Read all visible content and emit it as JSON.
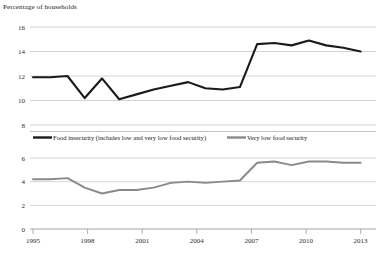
{
  "chart_data": {
    "type": "line",
    "title": "Percentage of households",
    "xlabel": "",
    "ylabel": "Percentage of households",
    "grid": true,
    "legend_position": "middle",
    "panels": [
      {
        "name": "food-insecurity-panel",
        "ylim": [
          8,
          16
        ],
        "yticks": [
          8,
          10,
          12,
          14,
          16
        ],
        "ytick_labels": [
          "8",
          "10",
          "12",
          "14",
          "16"
        ],
        "series_name": "Food insecurity (includes low and very low food security)",
        "color": "#1a1a1a"
      },
      {
        "name": "very-low-food-security-panel",
        "ylim": [
          0,
          6
        ],
        "yticks": [
          0,
          2,
          4,
          6
        ],
        "ytick_labels": [
          "0",
          "2",
          "4",
          "6"
        ],
        "series_name": "Very low food security",
        "color": "#8a8a8a"
      }
    ],
    "x": [
      1995,
      1996,
      1997,
      1998,
      1999,
      2000,
      2001,
      2002,
      2003,
      2004,
      2005,
      2006,
      2007,
      2008,
      2009,
      2010,
      2011,
      2012,
      2013,
      2014
    ],
    "xticks": [
      1995,
      1998,
      2001,
      2004,
      2007,
      2010,
      2013
    ],
    "xtick_labels": [
      "1995",
      "1998",
      "2001",
      "2004",
      "2007",
      "2010",
      "2013"
    ],
    "series": [
      {
        "name": "Food insecurity (includes low and very low food security)",
        "panel": 0,
        "color": "#1a1a1a",
        "values": [
          11.9,
          11.9,
          12.0,
          10.2,
          11.8,
          10.1,
          10.5,
          10.9,
          11.2,
          11.5,
          11.0,
          10.9,
          11.1,
          14.6,
          14.7,
          14.5,
          14.9,
          14.5,
          14.3,
          14.0
        ]
      },
      {
        "name": "Very low food security",
        "panel": 1,
        "color": "#8a8a8a",
        "values": [
          4.2,
          4.2,
          4.3,
          3.5,
          3.0,
          3.3,
          3.3,
          3.5,
          3.9,
          4.0,
          3.9,
          4.0,
          4.1,
          5.6,
          5.7,
          5.4,
          5.7,
          5.7,
          5.6,
          5.6
        ]
      }
    ]
  },
  "legend": {
    "items": [
      {
        "label": "Food insecurity (includes low and very low food security)",
        "color": "#1a1a1a",
        "swatch": "thick-line-swatch"
      },
      {
        "label": "Very low food security",
        "color": "#8a8a8a",
        "swatch": "thick-line-swatch"
      }
    ]
  },
  "yticks_top": [
    "16",
    "14",
    "12",
    "10",
    "8"
  ],
  "yticks_bottom": [
    "6",
    "4",
    "2",
    "0"
  ],
  "xticks": [
    "1995",
    "1998",
    "2001",
    "2004",
    "2007",
    "2010",
    "2013"
  ]
}
